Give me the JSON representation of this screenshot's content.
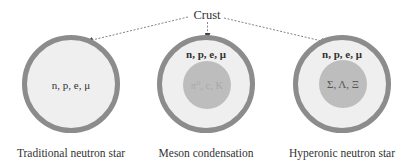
{
  "diagram": {
    "crust_label": "Crust",
    "colors": {
      "ring_stroke": "#8c8c8c",
      "ring_fill": "#efefef",
      "core_fill": "#bdbdbd",
      "text": "#333333",
      "arrow": "#777777"
    },
    "stars": [
      {
        "caption": "Traditional neutron star",
        "outer_particles": "n, p, e, μ",
        "core_particles": null
      },
      {
        "caption": "Meson condensation",
        "outer_particles": "n, p, e, μ",
        "core_particles": "π⁰, c, K"
      },
      {
        "caption": "Hyperonic neutron star",
        "outer_particles": "n, p, e, μ",
        "core_particles": "Σ, Λ, Ξ"
      }
    ]
  }
}
